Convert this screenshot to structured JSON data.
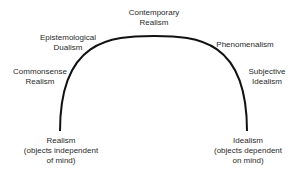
{
  "diagram": {
    "type": "arc-spectrum",
    "arc_color": "#111111",
    "left_end": {
      "title": "Realism",
      "line2": "(objects independent",
      "line3": "of mind)"
    },
    "right_end": {
      "title": "Idealism",
      "line2": "(objects dependent",
      "line3": "on mind)"
    },
    "positions": [
      {
        "line1": "Commonsense",
        "line2": "Realism"
      },
      {
        "line1": "Epistemological",
        "line2": "Dualism"
      },
      {
        "line1": "Contemporary",
        "line2": "Realism"
      },
      {
        "line1": "Phenomenalism",
        "line2": ""
      },
      {
        "line1": "Subjective",
        "line2": "Idealism"
      }
    ]
  }
}
